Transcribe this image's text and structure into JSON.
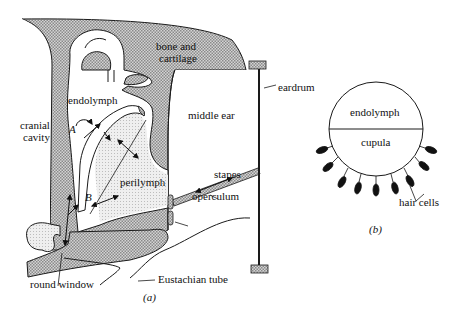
{
  "figure": {
    "panel_a": {
      "caption": "(a)",
      "labels": {
        "bone": "bone and",
        "bone2": "cartilage",
        "endolymph": "endolymph",
        "cranial1": "cranial",
        "cranial2": "cavity",
        "middle_ear": "middle ear",
        "eardrum": "eardrum",
        "perilymph": "perilymph",
        "stapes": "stapes",
        "operculum": "operculum",
        "round_window": "round window",
        "eustachian_tube": "Eustachian tube",
        "point_a": "A",
        "point_b": "B"
      }
    },
    "panel_b": {
      "caption": "(b)",
      "labels": {
        "endolymph": "endolymph",
        "cupula": "cupula",
        "hair_cells": "hair cells"
      }
    },
    "colors": {
      "stroke": "#1a1a1a",
      "bone_fill": "#c9c9c9",
      "perilymph_fill": "#e6e6e6",
      "background": "#ffffff"
    }
  }
}
